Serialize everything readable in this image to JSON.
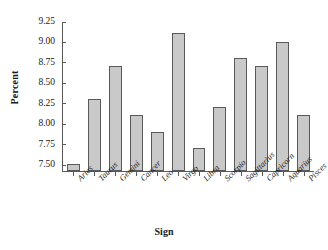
{
  "chart_data": {
    "type": "bar",
    "title": "",
    "xlabel": "Sign",
    "ylabel": "Percent",
    "categories": [
      "Aries",
      "Taurus",
      "Gemini",
      "Cancer",
      "Leo",
      "Virgo",
      "Libra",
      "Scorpio",
      "Sagittarius",
      "Capricorn",
      "Aquarius",
      "Pisces"
    ],
    "values": [
      7.5,
      8.3,
      8.7,
      8.1,
      7.9,
      9.1,
      7.7,
      8.2,
      8.8,
      8.7,
      9.0,
      8.1
    ],
    "ylim": [
      7.42,
      9.25
    ],
    "yticks": [
      7.5,
      7.75,
      8.0,
      8.25,
      8.5,
      8.75,
      9.0,
      9.25
    ],
    "ytick_labels": [
      "7.50",
      "7.75",
      "8.00",
      "8.25",
      "8.50",
      "8.75",
      "9.00",
      "9.25"
    ],
    "grid": false,
    "legend": null,
    "bar_color": "#c9c9c9",
    "bar_edge_color": "#595959",
    "axis_color": "#5a5a5a",
    "background": "#ffffff"
  }
}
